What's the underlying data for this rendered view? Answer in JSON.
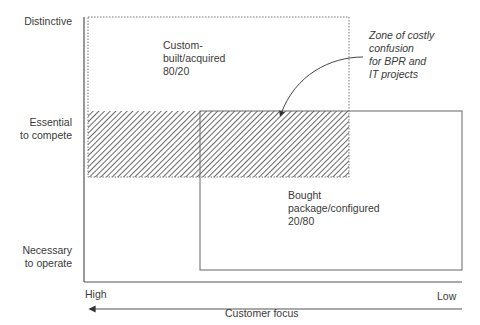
{
  "y_axis": {
    "labels": [
      {
        "line1": "Distinctive",
        "line2": ""
      },
      {
        "line1": "Essential",
        "line2": "to compete"
      },
      {
        "line1": "Necessary",
        "line2": "to operate"
      }
    ]
  },
  "x_axis": {
    "left_label": "High",
    "right_label": "Low",
    "title": "Customer focus"
  },
  "regions": {
    "custom": {
      "line1": "Custom-",
      "line2": "built/acquired",
      "line3": "80/20"
    },
    "package": {
      "line1": "Bought",
      "line2": "package/configured",
      "line3": "20/80"
    },
    "confusion": {
      "line1": "Zone of costly",
      "line2": "confusion",
      "line3": "for BPR and",
      "line4": "IT projects"
    }
  },
  "colors": {
    "line": "#555555",
    "hatch": "#444444",
    "text": "#3a3a3a"
  }
}
